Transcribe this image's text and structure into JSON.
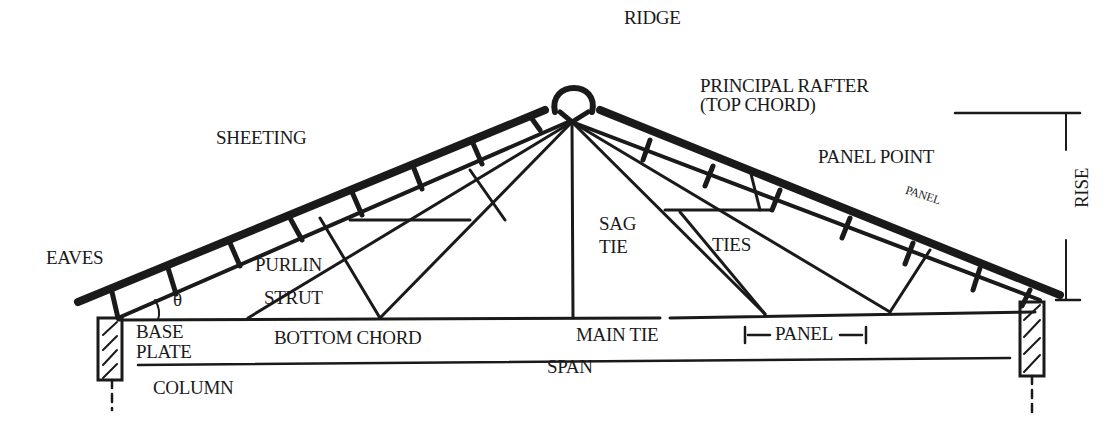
{
  "diagram": {
    "type": "roof-truss-anatomy",
    "labels": {
      "ridge": "RIDGE",
      "principal_rafter": "PRINCIPAL RAFTER",
      "top_chord": "(TOP CHORD)",
      "sheeting": "SHEETING",
      "panel_point": "PANEL POINT",
      "panel_top": "PANEL",
      "rise": "RISE",
      "eaves": "EAVES",
      "purlin": "PURLIN",
      "theta": "θ",
      "strut": "STRUT",
      "sag_tie_1": "SAG",
      "sag_tie_2": "TIE",
      "ties": "TIES",
      "base": "BASE",
      "plate": "PLATE",
      "bottom_chord": "BOTTOM CHORD",
      "main_tie": "MAIN TIE",
      "panel_bottom": "PANEL",
      "span": "SPAN",
      "column": "COLUMN"
    },
    "colors": {
      "ink": "#1a1a1a",
      "background": "#ffffff"
    }
  }
}
